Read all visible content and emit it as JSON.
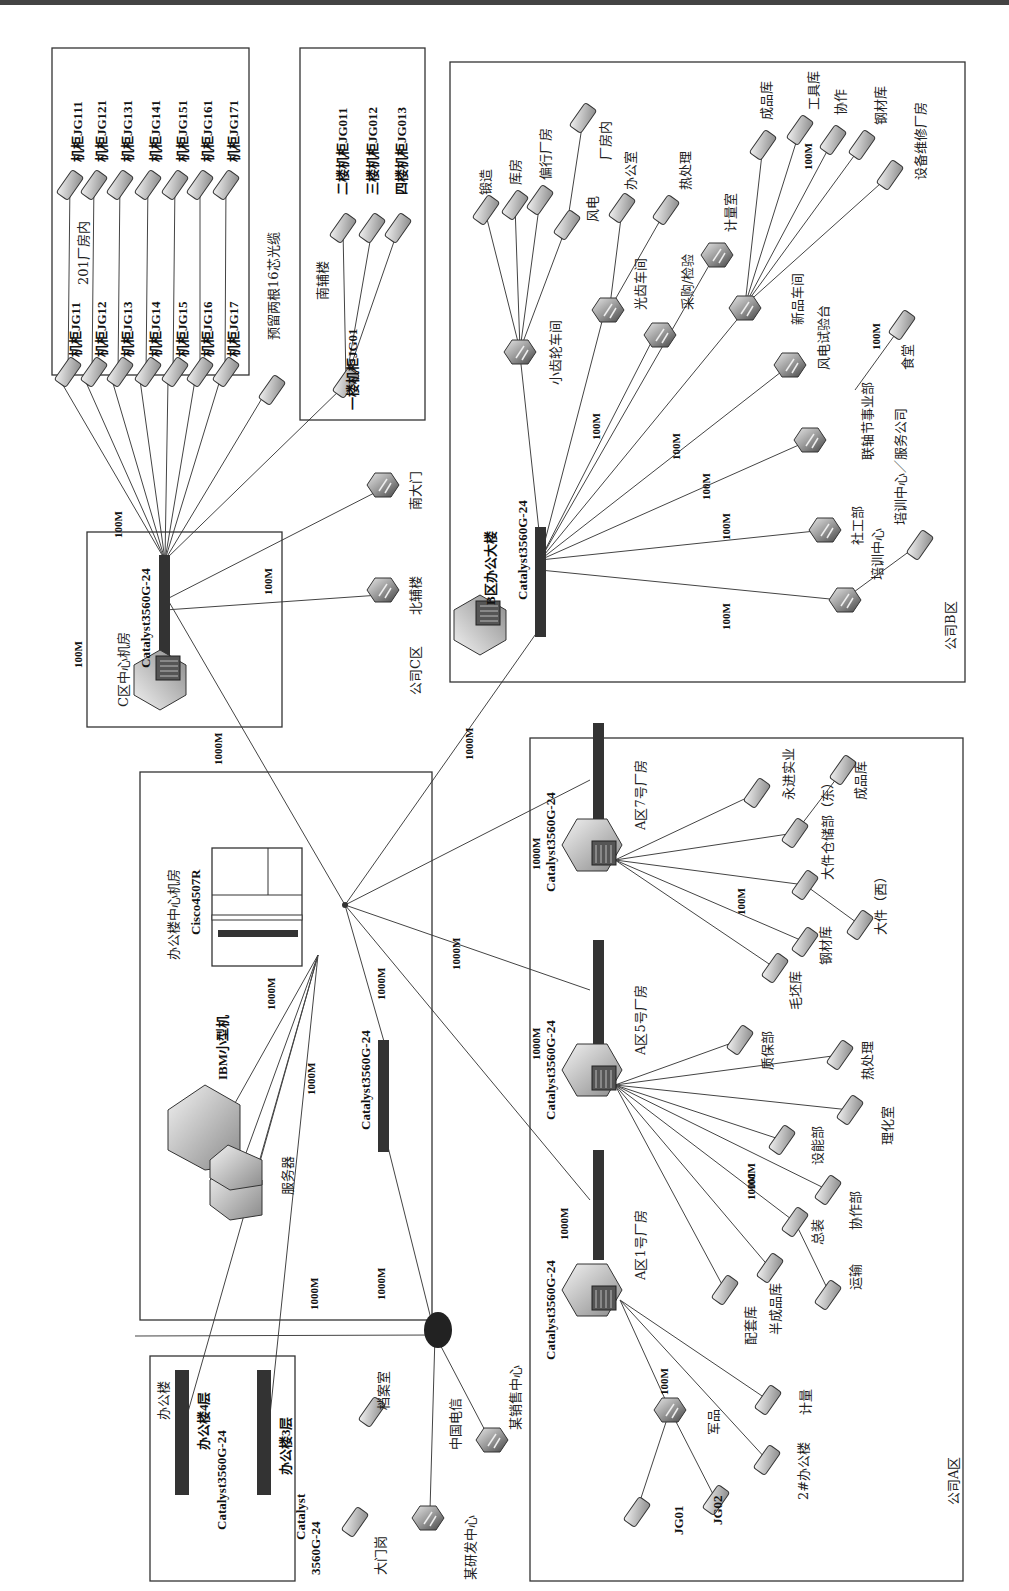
{
  "diagram": {
    "orientation": "rotated-90-ccw",
    "core": {
      "room_label": "办公楼中心机房",
      "core_switch": "Cisco4507R",
      "ibm_label": "IBM小型机",
      "server_label": "服务器",
      "agg_switch": "Catalyst3560G-24",
      "speeds": [
        "1000M",
        "1000M",
        "1000M",
        "1000M",
        "1000M",
        "1000M"
      ]
    },
    "zone_c": {
      "zone_label": "公司C区",
      "room_label": "C区中心机房",
      "switch": "Catalyst3560G-24",
      "uplink_speed": "1000M",
      "speed_left": "100M",
      "speed_top": "100M",
      "speed_right": "100M",
      "factory_box_label": "201厂房内",
      "cabinets_left": [
        "机柜JG11",
        "机柜JG12",
        "机柜JG13",
        "机柜JG14",
        "机柜JG15",
        "机柜JG16",
        "机柜JG17"
      ],
      "cabinets_right": [
        "机柜JG111",
        "机柜JG121",
        "机柜JG131",
        "机柜JG141",
        "机柜JG151",
        "机柜JG161",
        "机柜JG171"
      ],
      "reserve_label": "预留两根16芯光缆",
      "south_building": {
        "label": "南辅楼",
        "root": "一楼机柜JG01",
        "children": [
          "二楼机柜JG011",
          "三楼机柜JG012",
          "四楼机柜JG013"
        ]
      },
      "north_building": "北辅楼",
      "south_gate": "南大门"
    },
    "zone_b": {
      "zone_label": "公司B区",
      "building_label": "B区办公大楼",
      "switch": "Catalyst3560G-24",
      "uplink_speed": "1000M",
      "speeds": [
        "100M",
        "100M",
        "100M",
        "100M",
        "100M",
        "100M",
        "100M"
      ],
      "gear_workshop": {
        "label": "小齿轮车间",
        "children": [
          "锻造",
          "库房",
          "偏行厂房",
          "风电",
          "厂房内"
        ]
      },
      "light_workshop": {
        "label": "光齿车间",
        "children": [
          "办公室",
          "热处理"
        ]
      },
      "purchase": "采购/检验",
      "metrology": "计量室",
      "new_workshop": {
        "label": "新品车间",
        "children": [
          "成品库",
          "工具库",
          "协作",
          "钢材库",
          "设备维修厂房"
        ]
      },
      "wind_test": "风电试验台",
      "canteen": "食堂",
      "coupling": "联轴节事业部",
      "union": "社工部",
      "training": "培训中心",
      "training_service": "培训中心／服务公司"
    },
    "zone_a": {
      "zone_label": "公司A区",
      "plant7": {
        "label": "A区7号厂房",
        "switch": "Catalyst3560G-24",
        "uplink_speed": "1000M",
        "speed": "100M",
        "children": [
          "永进实业",
          "大件仓储部（东）",
          "成品库",
          "大件（西）",
          "钢材库",
          "毛坯库"
        ]
      },
      "plant5": {
        "label": "A区5号厂房",
        "switch": "Catalyst3560G-24",
        "uplink_speed": "1000M",
        "speed": "100M",
        "children": [
          "质保部",
          "热处理",
          "理化室",
          "设能部",
          "协作部"
        ]
      },
      "plant1": {
        "label": "A区1号厂房",
        "switch": "Catalyst3560G-24",
        "uplink_speed": "1000M",
        "speed": "100M",
        "children": [
          "总装",
          "运输",
          "半成品库",
          "配套库",
          "计量",
          "2#办公楼"
        ],
        "military": {
          "label": "军品",
          "children": [
            "JG01",
            "JG02"
          ]
        }
      }
    },
    "office": {
      "label": "办公楼",
      "floor4": "办公楼4层",
      "floor4_switch": "Catalyst3560G-24",
      "floor3": "办公楼3层",
      "floor3_switch_l1": "Catalyst",
      "floor3_switch_l2": "3560G-24",
      "archive": "档案室",
      "gate_post": "大门岗"
    },
    "wan": {
      "telecom": "中国电信",
      "sales": "某销售中心",
      "rnd": "某研发中心",
      "speed": "1000M"
    }
  }
}
